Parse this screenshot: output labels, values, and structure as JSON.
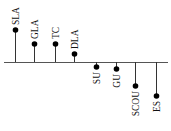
{
  "chart_data": {
    "type": "lollipop",
    "title": "",
    "xlabel": "",
    "ylabel": "",
    "grid": false,
    "legend": null,
    "baseline": 0,
    "categories": [
      "SLA",
      "GLA",
      "TC",
      "DLA",
      "SU",
      "GU",
      "SCOU",
      "ES"
    ],
    "values": [
      32,
      18,
      18,
      8,
      -5,
      -7,
      -24,
      -34
    ],
    "colors": {
      "stem": "#333333",
      "dot": "#000000",
      "baseline": "#555555",
      "text": "#111111"
    }
  },
  "layout": {
    "baseline_y": 62,
    "x_start": 4,
    "x_end": 168,
    "px_per_unit": 1,
    "xs": [
      15,
      34,
      55,
      74,
      96,
      116,
      135,
      156
    ]
  }
}
